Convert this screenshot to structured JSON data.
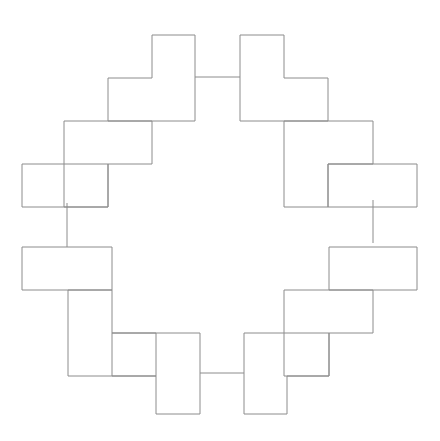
{
  "figure": {
    "title": "Rotationally symmetric ring of L-shaped tiles",
    "canvas": {
      "width": 440,
      "height": 441,
      "background": "#ffffff"
    },
    "stroke": {
      "color": "#8c8c8c",
      "width": 1
    },
    "grid_step": 43.5,
    "center": {
      "x": 220,
      "y": 221
    },
    "symmetry": "4-fold rotational (C4) with mirror symmetry",
    "tiles": [
      {
        "name": "tile-top-left",
        "shape": "L-shape",
        "points": "152,35 195,35 195,121 108,121 108,78 152,78"
      },
      {
        "name": "tile-top-right",
        "shape": "L-shape",
        "points": "240,35 284,35 284,78 328,78 328,121 240,121"
      },
      {
        "name": "tile-upper-left",
        "shape": "L-shape",
        "points": "64,121 152,121 152,164 108,164 108,207 64,207"
      },
      {
        "name": "tile-upper-right",
        "shape": "L-shape",
        "points": "284,121 373,121 373,164 328,164 328,207 284,207"
      },
      {
        "name": "tile-left-upper",
        "shape": "L-shape",
        "points": "22,164 108,164 108,207 22,207"
      },
      {
        "name": "tile-right-upper",
        "shape": "L-shape",
        "points": "328,164 417,164 417,207 328,207"
      },
      {
        "name": "tile-left-lower",
        "shape": "L-shape",
        "points": "22,247 112,247 112,290 68,290 68,290 22,290"
      },
      {
        "name": "tile-right-lower",
        "shape": "L-shape",
        "points": "329,247 417,247 417,290 373,290 329,290"
      },
      {
        "name": "tile-lower-left",
        "shape": "L-shape",
        "points": "68,290 112,290 112,333 156,333 156,376 68,376"
      },
      {
        "name": "tile-lower-right",
        "shape": "L-shape",
        "points": "373,290 373,333 329,333 329,376 284,376 284,290"
      },
      {
        "name": "tile-bottom-left",
        "shape": "L-shape",
        "points": "112,333 200,333 200,414 156,414 156,376 112,376"
      },
      {
        "name": "tile-bottom-right",
        "shape": "L-shape",
        "points": "244,333 329,333 329,376 287,376 287,414 244,414"
      }
    ],
    "connectors": [
      {
        "name": "connector-top",
        "orientation": "horizontal",
        "x1": 195,
        "y1": 77,
        "x2": 240,
        "y2": 77
      },
      {
        "name": "connector-bottom",
        "orientation": "horizontal",
        "x1": 200,
        "y1": 373,
        "x2": 244,
        "y2": 373
      },
      {
        "name": "connector-left",
        "orientation": "vertical",
        "x1": 67,
        "y1": 203,
        "x2": 67,
        "y2": 247
      },
      {
        "name": "connector-right",
        "orientation": "vertical",
        "x1": 373,
        "y1": 200,
        "x2": 373,
        "y2": 243
      }
    ],
    "outline_path": "M 152 35 L 195 35 L 195 77 L 240 77 L 240 35 L 284 35 L 284 78 L 328 78 L 328 121 L 373 121 L 373 164 L 417 164 L 417 207 L 373 207 L 373 247 L 417 247 L 417 290 L 373 290 L 373 333 L 329 333 L 329 376 L 287 376 L 287 414 L 244 414 L 244 373 L 200 373 L 200 414 L 156 414 L 156 376 L 112 376 L 112 333 L 68 333 L 68 290 L 22 290 L 22 247 L 67 247 L 67 207 L 22 207 L 22 164 L 64 164 L 64 121 L 108 121 L 108 78 L 152 78 Z",
    "inner_path": "M 195 121 L 240 121 L 240 121 L 284 121 L 284 164 L 328 164 L 328 207 L 328 247 L 328 290 L 284 290 L 284 333 L 244 333 L 244 376 L 200 376 L 200 333 L 156 333 L 156 290 L 112 290 L 112 247 L 112 207 L 112 164 L 152 164 L 152 121 Z",
    "internal_edges": [
      {
        "name": "edge-tl-inner-vertical",
        "x1": 152,
        "y1": 121,
        "x2": 152,
        "y2": 164
      },
      {
        "name": "edge-tl-inner-horizontal",
        "x1": 108,
        "y1": 121,
        "x2": 152,
        "y2": 121
      },
      {
        "name": "edge-tr-inner-horizontal",
        "x1": 284,
        "y1": 121,
        "x2": 328,
        "y2": 121
      },
      {
        "name": "edge-tr-inner-vertical",
        "x1": 284,
        "y1": 121,
        "x2": 284,
        "y2": 164
      }
    ]
  }
}
